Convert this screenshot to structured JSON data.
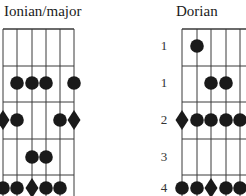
{
  "diagrams": [
    {
      "title": "Ionian/major",
      "title_x": 4,
      "strings_x": [
        3,
        17,
        32,
        46,
        60,
        74
      ],
      "frets_y": [
        29,
        66,
        102,
        139,
        175
      ],
      "row_labels": [],
      "notes": [
        {
          "row": 1,
          "string": 1,
          "shape": "dot"
        },
        {
          "row": 1,
          "string": 2,
          "shape": "dot"
        },
        {
          "row": 1,
          "string": 3,
          "shape": "dot"
        },
        {
          "row": 1,
          "string": 5,
          "shape": "dot"
        },
        {
          "row": 2,
          "string": 0,
          "shape": "diamond"
        },
        {
          "row": 2,
          "string": 1,
          "shape": "dot"
        },
        {
          "row": 2,
          "string": 4,
          "shape": "dot"
        },
        {
          "row": 2,
          "string": 5,
          "shape": "diamond"
        },
        {
          "row": 3,
          "string": 2,
          "shape": "dot"
        },
        {
          "row": 3,
          "string": 3,
          "shape": "dot"
        },
        {
          "row": 4,
          "string": 0,
          "shape": "dot"
        },
        {
          "row": 4,
          "string": 1,
          "shape": "dot"
        },
        {
          "row": 4,
          "string": 2,
          "shape": "diamond"
        },
        {
          "row": 4,
          "string": 3,
          "shape": "dot"
        },
        {
          "row": 4,
          "string": 4,
          "shape": "dot"
        }
      ]
    },
    {
      "title": "Dorian",
      "title_x": 197,
      "strings_x": [
        182,
        197,
        211,
        226,
        240,
        254
      ],
      "frets_y": [
        29,
        66,
        102,
        139,
        175
      ],
      "row_labels": [
        "1",
        "1",
        "2",
        "3",
        "4"
      ],
      "row_label_x": 158,
      "notes": [
        {
          "row": 0,
          "string": 1,
          "shape": "dot"
        },
        {
          "row": 1,
          "string": 2,
          "shape": "dot"
        },
        {
          "row": 1,
          "string": 3,
          "shape": "dot"
        },
        {
          "row": 2,
          "string": 0,
          "shape": "diamond"
        },
        {
          "row": 2,
          "string": 1,
          "shape": "dot"
        },
        {
          "row": 2,
          "string": 2,
          "shape": "dot"
        },
        {
          "row": 2,
          "string": 3,
          "shape": "dot"
        },
        {
          "row": 2,
          "string": 4,
          "shape": "dot"
        },
        {
          "row": 4,
          "string": 0,
          "shape": "dot"
        },
        {
          "row": 4,
          "string": 1,
          "shape": "dot"
        },
        {
          "row": 4,
          "string": 2,
          "shape": "diamond"
        },
        {
          "row": 4,
          "string": 3,
          "shape": "dot"
        },
        {
          "row": 4,
          "string": 4,
          "shape": "dot"
        }
      ]
    }
  ],
  "row_centers_y": [
    46,
    83,
    120,
    157,
    188
  ],
  "colors": {
    "line": "#3a3a3a",
    "note": "#1a1a1a"
  }
}
